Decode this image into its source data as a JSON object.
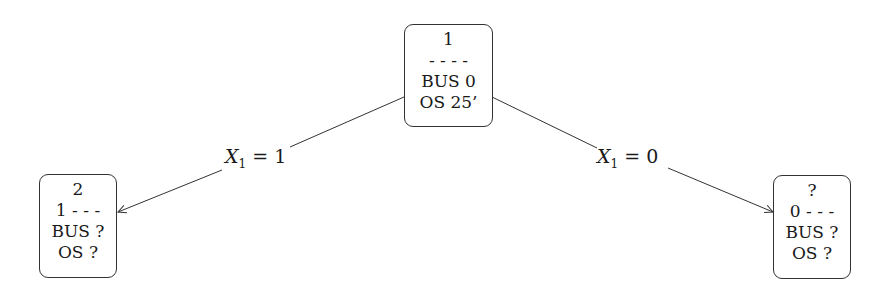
{
  "diagram": {
    "type": "tree",
    "nodes": [
      {
        "id": "root",
        "lines": [
          "1",
          "- - - -",
          "BUS 0",
          "OS 25’"
        ]
      },
      {
        "id": "left",
        "lines": [
          "2",
          "1 - - -",
          "BUS ?",
          "OS ?"
        ]
      },
      {
        "id": "right",
        "lines": [
          "?",
          "0 - - -",
          "BUS ?",
          "OS ?"
        ]
      }
    ],
    "edges": [
      {
        "from": "root",
        "to": "left",
        "label": {
          "var": "X",
          "sub": "1",
          "rest": " = 1"
        }
      },
      {
        "from": "root",
        "to": "right",
        "label": {
          "var": "X",
          "sub": "1",
          "rest": " = 0"
        }
      }
    ],
    "colors": {
      "stroke": "#333333",
      "background": "#ffffff"
    }
  }
}
